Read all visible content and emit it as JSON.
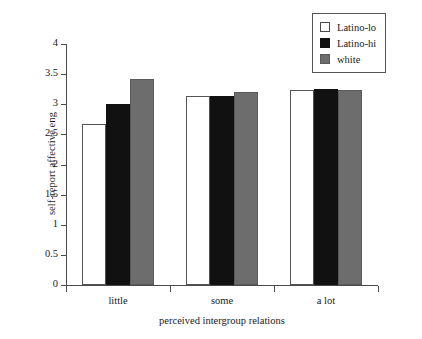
{
  "chart_data": {
    "type": "bar",
    "title": "",
    "subtitle": "",
    "xlabel": "perceived intergroup relations",
    "ylabel": "self-report affective eng",
    "categories": [
      "little",
      "some",
      "a lot"
    ],
    "series": [
      {
        "name": "Latino-lo",
        "color": "#ffffff",
        "values": [
          2.67,
          3.14,
          3.23
        ]
      },
      {
        "name": "Latino-hi",
        "color": "#111111",
        "values": [
          3.0,
          3.14,
          3.25
        ]
      },
      {
        "name": "white",
        "color": "#6d6d6d",
        "values": [
          3.42,
          3.2,
          3.24
        ]
      }
    ],
    "ylim": [
      0,
      4
    ],
    "ytick_labels": [
      "0",
      "0.5",
      "1",
      "1.5",
      "2",
      "2.5",
      "3",
      "3.5",
      "4"
    ],
    "ytick_values": [
      0,
      0.5,
      1,
      1.5,
      2,
      2.5,
      3,
      3.5,
      4
    ],
    "grid": false,
    "legend_position": "top-right"
  },
  "legend": {
    "entries": [
      {
        "label": "Latino-lo",
        "swatch": "white-square-outline-icon"
      },
      {
        "label": "Latino-hi",
        "swatch": "black-square-icon"
      },
      {
        "label": "white",
        "swatch": "gray-square-icon"
      }
    ]
  }
}
